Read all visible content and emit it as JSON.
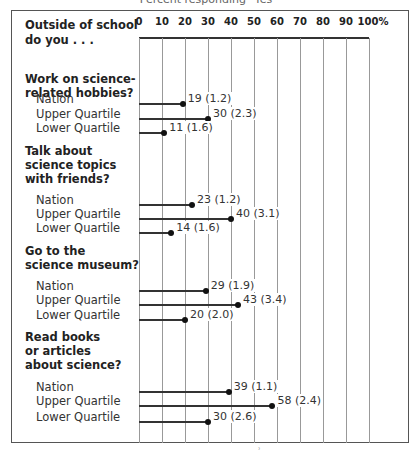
{
  "header": {
    "partial_title": "Percent responding \"Yes\""
  },
  "axis_header": {
    "line1": "Outside of school",
    "line2": "do you . . ."
  },
  "chart_data": {
    "type": "bar",
    "orientation": "horizontal",
    "xlabel": "Percent",
    "xlim": [
      0,
      100
    ],
    "ticks": [
      "0",
      "10",
      "20",
      "30",
      "40",
      "50",
      "60",
      "70",
      "80",
      "90",
      "100%"
    ],
    "grid": true,
    "groups": [
      {
        "question": [
          "Work on science-",
          "related hobbies?"
        ],
        "rows": [
          {
            "label": "Nation",
            "value": 19,
            "se": "1.2",
            "text": "19 (1.2)"
          },
          {
            "label": "Upper Quartile",
            "value": 30,
            "se": "2.3",
            "text": "30 (2.3)"
          },
          {
            "label": "Lower Quartile",
            "value": 11,
            "se": "1.6",
            "text": "11 (1.6)"
          }
        ]
      },
      {
        "question": [
          "Talk about",
          "science topics",
          "with friends?"
        ],
        "rows": [
          {
            "label": "Nation",
            "value": 23,
            "se": "1.2",
            "text": "23 (1.2)"
          },
          {
            "label": "Upper Quartile",
            "value": 40,
            "se": "3.1",
            "text": "40 (3.1)"
          },
          {
            "label": "Lower Quartile",
            "value": 14,
            "se": "1.6",
            "text": "14 (1.6)"
          }
        ]
      },
      {
        "question": [
          "Go to the",
          "science museum?"
        ],
        "rows": [
          {
            "label": "Nation",
            "value": 29,
            "se": "1.9",
            "text": "29 (1.9)"
          },
          {
            "label": "Upper Quartile",
            "value": 43,
            "se": "3.4",
            "text": "43 (3.4)"
          },
          {
            "label": "Lower Quartile",
            "value": 20,
            "se": "2.0",
            "text": "20 (2.0)"
          }
        ]
      },
      {
        "question": [
          "Read books",
          "or articles",
          "about science?"
        ],
        "rows": [
          {
            "label": "Nation",
            "value": 39,
            "se": "1.1",
            "text": "39 (1.1)"
          },
          {
            "label": "Upper Quartile",
            "value": 58,
            "se": "2.4",
            "text": "58 (2.4)"
          },
          {
            "label": "Lower Quartile",
            "value": 30,
            "se": "2.6",
            "text": "30 (2.6)"
          }
        ]
      }
    ]
  }
}
